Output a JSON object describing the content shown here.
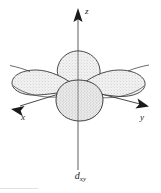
{
  "figure": {
    "background_color": "#ffffff",
    "line_color": "#1a1a1a",
    "lobe_fill_color": "#ededed",
    "lobe_stipple_color": "#9a9a9a",
    "axis_color": "#5a5a5a"
  },
  "axes": [
    {
      "name": "z-axis",
      "label": "z",
      "direction": "up",
      "arrow": true,
      "arrow_position": "top"
    },
    {
      "name": "x-axis",
      "label": "x",
      "direction": "down-left",
      "arrow": true,
      "arrow_position": "lower-left"
    },
    {
      "name": "y-axis",
      "label": "y",
      "direction": "right",
      "arrow": true,
      "arrow_position": "right"
    }
  ],
  "lobes": [
    {
      "name": "lobe-left-front",
      "orientation": "toward -x, front-left"
    },
    {
      "name": "lobe-right-front",
      "orientation": "toward +y, front-right"
    },
    {
      "name": "lobe-back-upper",
      "orientation": "back, upper-center"
    },
    {
      "name": "lobe-front-lower",
      "orientation": "front, lower-center"
    }
  ],
  "caption": {
    "symbol": "d",
    "subscript": "xy",
    "full_text": "dxy"
  }
}
